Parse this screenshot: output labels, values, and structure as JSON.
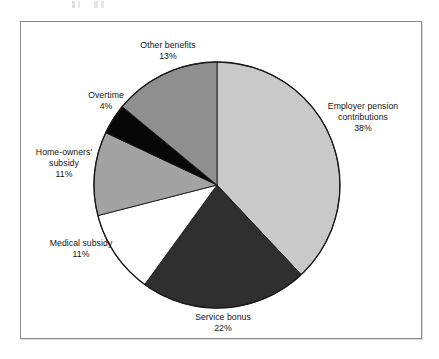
{
  "figure": {
    "background_color": "#ffffff",
    "frame_color": "#8c8c8c"
  },
  "chart_data": {
    "type": "pie",
    "title": "",
    "subtitle": "",
    "xlabel": "",
    "ylabel": "",
    "legend_position": "none",
    "labels_position": "outside-with-leader-free",
    "start_angle_deg": 0,
    "direction": "clockwise",
    "units": "percent",
    "total": 100,
    "categories": [
      "Employer pension contributions",
      "Service bonus",
      "Medical subsidy",
      "Home-owners' subsidy",
      "Overtime",
      "Other benefits"
    ],
    "values": [
      38,
      22,
      11,
      11,
      4,
      13
    ],
    "colors": [
      "#c9c9c9",
      "#2f2f2f",
      "#ffffff",
      "#a3a3a3",
      "#070707",
      "#8f8f8f"
    ],
    "slices": [
      {
        "name": "Employer pension contributions",
        "label_line1": "Employer pension",
        "label_line2": "contributions",
        "value": 38,
        "percent_text": "38%",
        "color": "#c9c9c9",
        "start_deg": 0,
        "end_deg": 136.8
      },
      {
        "name": "Service bonus",
        "label_line1": "Service bonus",
        "label_line2": "",
        "value": 22,
        "percent_text": "22%",
        "color": "#2f2f2f",
        "start_deg": 136.8,
        "end_deg": 216.0
      },
      {
        "name": "Medical subsidy",
        "label_line1": "Medical subsidy",
        "label_line2": "",
        "value": 11,
        "percent_text": "11%",
        "color": "#ffffff",
        "start_deg": 216.0,
        "end_deg": 255.6
      },
      {
        "name": "Home-owners' subsidy",
        "label_line1": "Home-owners'",
        "label_line2": "subsidy",
        "value": 11,
        "percent_text": "11%",
        "color": "#a3a3a3",
        "start_deg": 255.6,
        "end_deg": 295.2
      },
      {
        "name": "Overtime",
        "label_line1": "Overtime",
        "label_line2": "",
        "value": 4,
        "percent_text": "4%",
        "color": "#070707",
        "start_deg": 295.2,
        "end_deg": 309.6
      },
      {
        "name": "Other benefits",
        "label_line1": "Other benefits",
        "label_line2": "",
        "value": 13,
        "percent_text": "13%",
        "color": "#8f8f8f",
        "start_deg": 309.6,
        "end_deg": 360.0
      }
    ],
    "geometry": {
      "center_x": 217,
      "center_y": 185,
      "radius": 123,
      "outline_color": "#1a1a1a"
    }
  }
}
